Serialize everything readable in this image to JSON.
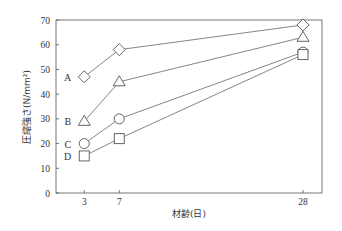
{
  "chart_data": {
    "type": "line",
    "title": "",
    "xlabel": "材齢(日)",
    "ylabel": "圧縮強さ(N/mm²)",
    "x": [
      3,
      7,
      28
    ],
    "xticks": [
      "3",
      "7",
      "28"
    ],
    "yticks": [
      "0",
      "10",
      "20",
      "30",
      "40",
      "50",
      "60",
      "70"
    ],
    "ylim": [
      0,
      70
    ],
    "grid": false,
    "legend": "inline labels left of first point",
    "series": [
      {
        "name": "A",
        "marker": "diamond",
        "values": [
          47,
          58,
          68
        ]
      },
      {
        "name": "B",
        "marker": "triangle",
        "values": [
          29,
          45,
          63
        ]
      },
      {
        "name": "C",
        "marker": "circle",
        "values": [
          20,
          30,
          57
        ]
      },
      {
        "name": "D",
        "marker": "square",
        "values": [
          15,
          22,
          56
        ]
      }
    ]
  }
}
